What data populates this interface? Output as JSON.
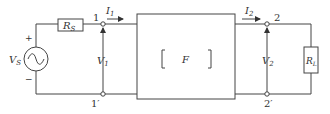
{
  "diagram": {
    "type": "two-port network circuit",
    "source": {
      "label": "V",
      "sub": "S",
      "plus": "+",
      "minus": "−",
      "kind": "AC voltage source"
    },
    "source_resistor": {
      "label": "R",
      "sub": "S"
    },
    "load_resistor": {
      "label": "R",
      "sub": "L"
    },
    "network": {
      "label": "F",
      "bracket_left": "[",
      "bracket_right": "]"
    },
    "port1": {
      "top": "1",
      "bottom": "1′",
      "voltage": "V",
      "voltage_sub": "1",
      "current": "I",
      "current_sub": "1"
    },
    "port2": {
      "top": "2",
      "bottom": "2′",
      "voltage": "V",
      "voltage_sub": "2",
      "current": "I",
      "current_sub": "2"
    },
    "colors": {
      "line": "#444444",
      "text": "#333333",
      "background": "#ffffff"
    }
  }
}
